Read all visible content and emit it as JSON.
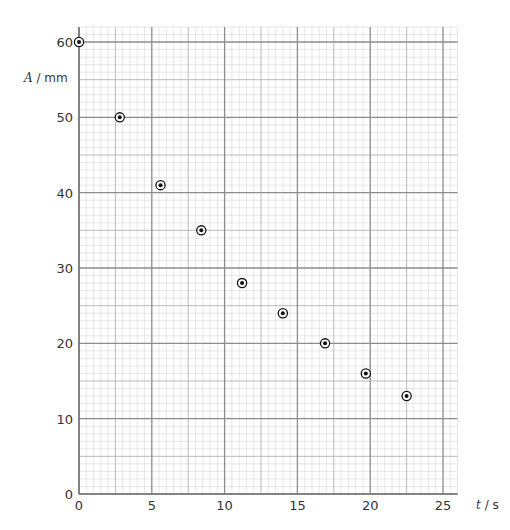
{
  "chart_data": {
    "type": "scatter",
    "title": "",
    "xlabel": "t / s",
    "ylabel": "A / mm",
    "xlabel_var": "t",
    "xlabel_unit": " / s",
    "ylabel_var": "A",
    "ylabel_unit": " / mm",
    "xlim": [
      0,
      26
    ],
    "ylim": [
      0,
      62
    ],
    "x_ticks": [
      0,
      5,
      10,
      15,
      20,
      25
    ],
    "y_ticks": [
      0,
      10,
      20,
      30,
      40,
      50,
      60
    ],
    "grid": true,
    "minor_grid": {
      "x_step": 0.5,
      "y_step": 1
    },
    "legend": null,
    "series": [
      {
        "name": "amplitude",
        "marker": "circled-dot",
        "points": [
          {
            "x": 0,
            "y": 60
          },
          {
            "x": 2.8,
            "y": 50
          },
          {
            "x": 5.6,
            "y": 41
          },
          {
            "x": 8.4,
            "y": 35
          },
          {
            "x": 11.2,
            "y": 28
          },
          {
            "x": 14.0,
            "y": 24
          },
          {
            "x": 16.9,
            "y": 20
          },
          {
            "x": 19.7,
            "y": 16
          },
          {
            "x": 22.5,
            "y": 13
          }
        ]
      }
    ]
  },
  "colors": {
    "minor_grid": "#d6d6d6",
    "mid_grid": "#b3b3b3",
    "major_grid": "#8c8c8c",
    "marker": "#111111",
    "text": "#333333"
  }
}
